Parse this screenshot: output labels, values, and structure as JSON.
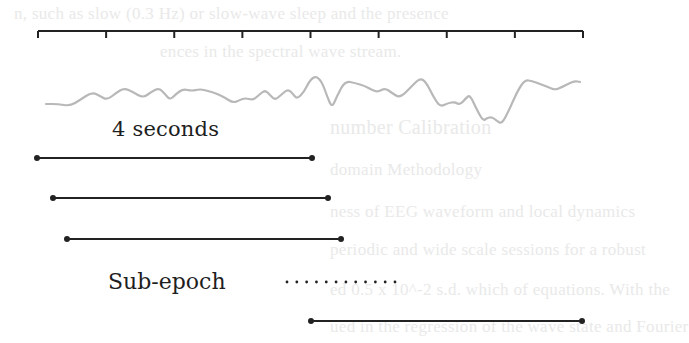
{
  "figure": {
    "ruler": {
      "tick_count": 9,
      "x_start": 38,
      "x_end": 583,
      "y": 31,
      "tick_length": 7,
      "color": "#222222"
    },
    "signal": {
      "color": "#b8b8b8",
      "points": [
        [
          46,
          104
        ],
        [
          58,
          104
        ],
        [
          70,
          106
        ],
        [
          80,
          100
        ],
        [
          92,
          92
        ],
        [
          100,
          96
        ],
        [
          107,
          100
        ],
        [
          116,
          93
        ],
        [
          124,
          88
        ],
        [
          133,
          92
        ],
        [
          143,
          98
        ],
        [
          151,
          92
        ],
        [
          159,
          88
        ],
        [
          165,
          94
        ],
        [
          170,
          100
        ],
        [
          176,
          94
        ],
        [
          183,
          89
        ],
        [
          192,
          91
        ],
        [
          200,
          89
        ],
        [
          208,
          91
        ],
        [
          215,
          93
        ],
        [
          224,
          97
        ],
        [
          233,
          103
        ],
        [
          240,
          100
        ],
        [
          245,
          98
        ],
        [
          253,
          100
        ],
        [
          259,
          95
        ],
        [
          265,
          90
        ],
        [
          270,
          95
        ],
        [
          275,
          100
        ],
        [
          281,
          95
        ],
        [
          288,
          89
        ],
        [
          293,
          94
        ],
        [
          297,
          99
        ],
        [
          304,
          92
        ],
        [
          310,
          80
        ],
        [
          316,
          76
        ],
        [
          322,
          82
        ],
        [
          327,
          96
        ],
        [
          332,
          108
        ],
        [
          337,
          96
        ],
        [
          345,
          81
        ],
        [
          355,
          83
        ],
        [
          365,
          86
        ],
        [
          372,
          90
        ],
        [
          378,
          92
        ],
        [
          385,
          88
        ],
        [
          392,
          93
        ],
        [
          400,
          98
        ],
        [
          410,
          88
        ],
        [
          420,
          78
        ],
        [
          426,
          82
        ],
        [
          433,
          96
        ],
        [
          440,
          107
        ],
        [
          448,
          103
        ],
        [
          455,
          102
        ],
        [
          460,
          105
        ],
        [
          466,
          98
        ],
        [
          470,
          95
        ],
        [
          476,
          108
        ],
        [
          483,
          121
        ],
        [
          487,
          118
        ],
        [
          492,
          117
        ],
        [
          497,
          121
        ],
        [
          502,
          124
        ],
        [
          510,
          108
        ],
        [
          518,
          90
        ],
        [
          525,
          80
        ],
        [
          532,
          81
        ],
        [
          540,
          84
        ],
        [
          548,
          87
        ],
        [
          555,
          90
        ],
        [
          562,
          87
        ],
        [
          570,
          83
        ],
        [
          575,
          81
        ],
        [
          580,
          82
        ]
      ]
    },
    "labels": {
      "duration": "4 seconds",
      "sub_epoch": "Sub-epoch"
    },
    "segments": [
      {
        "x1": 37,
        "x2": 312,
        "y": 158
      },
      {
        "x1": 53,
        "x2": 328,
        "y": 198
      },
      {
        "x1": 67,
        "x2": 341,
        "y": 239
      },
      {
        "x1": 311,
        "x2": 582,
        "y": 321
      }
    ],
    "ellipsis": {
      "count": 12,
      "x_start": 287,
      "x_end": 395,
      "y": 282
    },
    "segment_color": "#222222"
  },
  "background_bleed": {
    "lines": [
      {
        "text": "n, such as slow (0.3 Hz) or slow-wave sleep and the presence",
        "x": 14,
        "y": 14
      },
      {
        "text": "ences in the spectral wave stream.",
        "x": 160,
        "y": 52
      },
      {
        "text": "number Calibration",
        "x": 330,
        "y": 126
      },
      {
        "text": "domain Methodology",
        "x": 330,
        "y": 170
      },
      {
        "text": "ness of EEG waveform and local dynamics",
        "x": 330,
        "y": 212
      },
      {
        "text": "periodic and wide scale sessions for a robust",
        "x": 330,
        "y": 250
      },
      {
        "text": "ed 0.5 x 10^-2 s.d. which of equations. With the",
        "x": 330,
        "y": 290
      },
      {
        "text": "ued in the regression of the wave state and Fourier",
        "x": 330,
        "y": 327
      }
    ]
  }
}
